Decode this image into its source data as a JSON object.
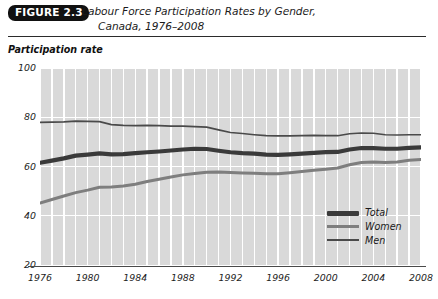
{
  "figure": {
    "badge": "FIGURE 2.3",
    "title_line1": "Labour Force Participation Rates by Gender,",
    "title_line2": "Canada, 1976–2008",
    "axis_caption": "Participation rate"
  },
  "legend": {
    "position": "inside-bottom-right",
    "entries": [
      {
        "label": "Total",
        "color": "#3a3a3a",
        "width": 4.5
      },
      {
        "label": "Women",
        "color": "#7e7e7e",
        "width": 3.0
      },
      {
        "label": "Men",
        "color": "#4a4a4a",
        "width": 1.6
      }
    ]
  },
  "chart_data": {
    "type": "line",
    "title": "Labour Force Participation Rates by Gender, Canada, 1976–2008",
    "xlabel": "",
    "ylabel": "Participation rate",
    "xlim": [
      1976,
      2008
    ],
    "ylim": [
      20,
      100
    ],
    "yticks": [
      100,
      80,
      60,
      40,
      20
    ],
    "xticks": [
      1976,
      1980,
      1984,
      1988,
      1992,
      1996,
      2000,
      2004,
      2008
    ],
    "grid": true,
    "grid_color": "#ffffff",
    "plot_background": "#d9d9d9",
    "x": [
      1976,
      1977,
      1978,
      1979,
      1980,
      1981,
      1982,
      1983,
      1984,
      1985,
      1986,
      1987,
      1988,
      1989,
      1990,
      1991,
      1992,
      1993,
      1994,
      1995,
      1996,
      1997,
      1998,
      1999,
      2000,
      2001,
      2002,
      2003,
      2004,
      2005,
      2006,
      2007,
      2008
    ],
    "series": [
      {
        "name": "Men",
        "color": "#4a4a4a",
        "values": [
          77.9,
          78.0,
          78.1,
          78.4,
          78.3,
          78.2,
          77.0,
          76.7,
          76.6,
          76.7,
          76.6,
          76.4,
          76.4,
          76.2,
          76.0,
          74.9,
          73.8,
          73.4,
          72.9,
          72.5,
          72.4,
          72.4,
          72.5,
          72.6,
          72.5,
          72.5,
          73.3,
          73.6,
          73.5,
          72.9,
          72.8,
          72.9,
          72.9
        ]
      },
      {
        "name": "Total",
        "color": "#3a3a3a",
        "values": [
          61.5,
          62.4,
          63.3,
          64.4,
          64.8,
          65.3,
          64.9,
          65.0,
          65.4,
          65.8,
          66.1,
          66.5,
          66.9,
          67.2,
          67.1,
          66.4,
          65.8,
          65.4,
          65.2,
          64.8,
          64.7,
          64.9,
          65.2,
          65.5,
          65.8,
          65.9,
          66.9,
          67.5,
          67.5,
          67.2,
          67.2,
          67.6,
          67.8
        ]
      },
      {
        "name": "Women",
        "color": "#7e7e7e",
        "values": [
          45.2,
          46.6,
          48.0,
          49.4,
          50.4,
          51.6,
          51.7,
          52.1,
          52.8,
          53.9,
          54.8,
          55.7,
          56.6,
          57.2,
          57.7,
          57.8,
          57.6,
          57.4,
          57.3,
          57.1,
          57.1,
          57.5,
          58.0,
          58.5,
          58.9,
          59.4,
          60.7,
          61.6,
          61.8,
          61.6,
          61.8,
          62.5,
          62.8
        ]
      }
    ]
  }
}
